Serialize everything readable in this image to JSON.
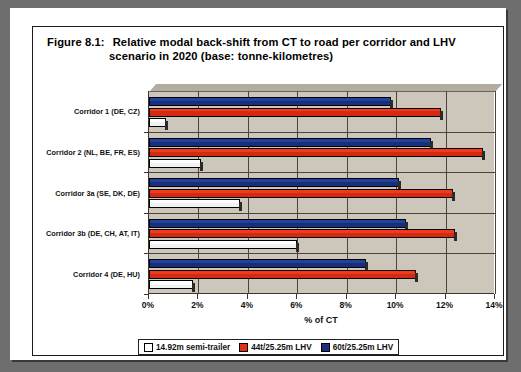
{
  "figure": {
    "label": "Figure 8.1:",
    "title_line1": "Relative modal back-shift from CT to road per corridor and LHV",
    "title_line2": "scenario in 2020 (base: tonne-kilometres)"
  },
  "chart_data": {
    "type": "bar",
    "orientation": "horizontal",
    "xlabel": "% of CT",
    "ylabel": "",
    "xlim": [
      0,
      14
    ],
    "xticks": [
      "0%",
      "2%",
      "4%",
      "6%",
      "8%",
      "10%",
      "12%",
      "14%"
    ],
    "xtick_values": [
      0,
      2,
      4,
      6,
      8,
      10,
      12,
      14
    ],
    "grid": true,
    "legend_position": "bottom",
    "categories": [
      "Corridor 1 (DE, CZ)",
      "Corridor 2 (NL, BE, FR, ES)",
      "Corridor 3a (SE, DK, DE)",
      "Corridor 3b (DE, CH, AT, IT)",
      "Corridor 4 (DE, HU)"
    ],
    "series": [
      {
        "name": "14.92m semi-trailer",
        "color": "#ffffff",
        "values": [
          0.7,
          2.1,
          3.7,
          6.0,
          1.8
        ]
      },
      {
        "name": "44t/25.25m LHV",
        "color": "#e0301a",
        "values": [
          11.8,
          13.5,
          12.3,
          12.4,
          10.8
        ]
      },
      {
        "name": "60t/25.25m LHV",
        "color": "#1b2f80",
        "values": [
          9.8,
          11.4,
          10.1,
          10.4,
          8.8
        ]
      }
    ]
  },
  "legend": {
    "items": [
      {
        "label": "14.92m semi-trailer",
        "swatch": "sw-white"
      },
      {
        "label": "44t/25.25m LHV",
        "swatch": "sw-red"
      },
      {
        "label": "60t/25.25m LHV",
        "swatch": "sw-blue"
      }
    ]
  }
}
